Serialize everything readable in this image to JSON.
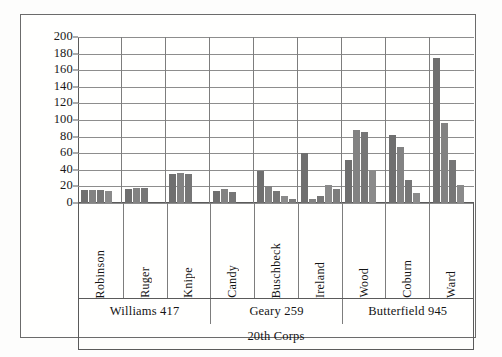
{
  "chart_data": {
    "type": "bar",
    "title": "",
    "xlabel": "20th Corps",
    "ylabel": "",
    "ylim": [
      0,
      200
    ],
    "ytick_step": 20,
    "yticks": [
      200,
      180,
      160,
      140,
      120,
      100,
      80,
      60,
      40,
      20,
      0
    ],
    "grid": true,
    "legend": "none",
    "orientation": "vertical",
    "bar_color": "#7a7a7a",
    "categories": [
      "Robinson",
      "Ruger",
      "Knipe",
      "Candy",
      "Buschbeck",
      "Ireland",
      "Wood",
      "Coburn",
      "Ward"
    ],
    "groups": [
      {
        "label": "Williams 417",
        "categories": [
          "Robinson",
          "Ruger",
          "Knipe"
        ]
      },
      {
        "label": "Geary 259",
        "categories": [
          "Candy",
          "Buschbeck",
          "Ireland"
        ]
      },
      {
        "label": "Butterfield 945",
        "categories": [
          "Wood",
          "Coburn",
          "Ward"
        ]
      }
    ],
    "bars_by_category": [
      {
        "category": "Robinson",
        "values": [
          16,
          16,
          16,
          15
        ]
      },
      {
        "category": "Ruger",
        "values": [
          17,
          18,
          18
        ]
      },
      {
        "category": "Knipe",
        "values": [
          35,
          36,
          35
        ]
      },
      {
        "category": "Candy",
        "values": [
          15,
          17,
          13
        ]
      },
      {
        "category": "Buschbeck",
        "values": [
          38,
          20,
          14,
          8,
          5
        ]
      },
      {
        "category": "Ireland",
        "values": [
          60,
          5,
          9,
          22,
          17
        ]
      },
      {
        "category": "Wood",
        "values": [
          52,
          88,
          85,
          38
        ]
      },
      {
        "category": "Coburn",
        "values": [
          82,
          68,
          28,
          12
        ]
      },
      {
        "category": "Ward",
        "values": [
          175,
          97,
          52,
          22
        ]
      }
    ]
  },
  "axis": {
    "y_tick_labels": [
      "200",
      "180",
      "160",
      "140",
      "120",
      "100",
      "80",
      "60",
      "40",
      "20",
      "0"
    ]
  },
  "labels": {
    "categories": [
      "Robinson",
      "Ruger",
      "Knipe",
      "Candy",
      "Buschbeck",
      "Ireland",
      "Wood",
      "Coburn",
      "Ward"
    ],
    "divisions": [
      "Williams 417",
      "Geary 259",
      "Butterfield 945"
    ],
    "corps": "20th Corps"
  }
}
